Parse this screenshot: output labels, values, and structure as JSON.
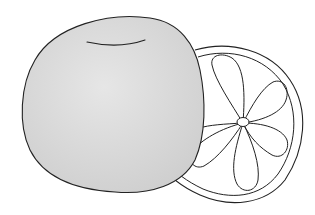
{
  "illustration": {
    "subject": "citrus fruit line drawing",
    "elements": [
      "whole-fruit",
      "fruit-slice"
    ],
    "colors": {
      "background": "#ffffff",
      "fruit_fill": "#d6d6d6",
      "fruit_fill_light": "#e4e4e4",
      "outline": "#222222",
      "slice_fill": "#ffffff"
    }
  }
}
